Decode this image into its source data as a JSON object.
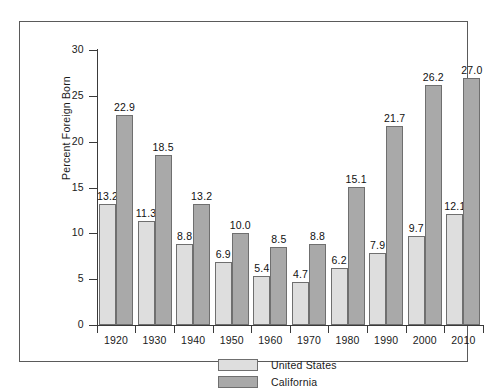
{
  "chart_data": {
    "type": "bar",
    "title": "",
    "xlabel": "",
    "ylabel": "Percent Foreign Born",
    "categories": [
      "1920",
      "1930",
      "1940",
      "1950",
      "1960",
      "1970",
      "1980",
      "1990",
      "2000",
      "2010"
    ],
    "series": [
      {
        "name": "United States",
        "color": "#dedede",
        "values": [
          13.2,
          11.3,
          8.8,
          6.9,
          5.4,
          4.7,
          6.2,
          7.9,
          9.7,
          12.1
        ],
        "labels": [
          "13.2",
          "11.3",
          "8.8",
          "6.9",
          "5.4",
          "4.7",
          "6.2",
          "7.9",
          "9.7",
          "12.1"
        ]
      },
      {
        "name": "California",
        "color": "#a9a9a9",
        "values": [
          22.9,
          18.5,
          13.2,
          10.0,
          8.5,
          8.8,
          15.1,
          21.7,
          26.2,
          27.0
        ],
        "labels": [
          "22.9",
          "18.5",
          "13.2",
          "10.0",
          "8.5",
          "8.8",
          "15.1",
          "21.7",
          "26.2",
          "27.0"
        ]
      }
    ],
    "ylim": [
      0,
      30
    ],
    "yticks": [
      0,
      5,
      10,
      15,
      20,
      25,
      30
    ],
    "ytick_labels": [
      "0",
      "5",
      "10",
      "15",
      "20",
      "25",
      "30"
    ],
    "grid": false,
    "legend_position": "bottom-center",
    "legend": [
      {
        "label": "United States",
        "color": "#dedede"
      },
      {
        "label": "California",
        "color": "#a9a9a9"
      }
    ]
  }
}
